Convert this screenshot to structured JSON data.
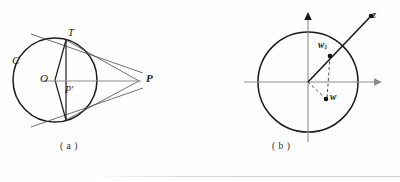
{
  "figure": {
    "page_background": "#fefefe",
    "ink_color": "#1a1a1a",
    "thin_color": "#555555",
    "panels": [
      {
        "id": "a",
        "caption": "( a )",
        "description": "circle with tangent point T, center O, inverse point P-prime and external point P",
        "labels": {
          "circle_name": "C",
          "tangent_point": "T",
          "center": "O",
          "inverse_point": "P′",
          "external_point": "P"
        },
        "geometry": {
          "circle_center": [
            55,
            80
          ],
          "circle_radius": 42,
          "point_T": [
            66,
            40
          ],
          "point_T_lower": [
            66,
            120
          ],
          "point_P": [
            139,
            81
          ],
          "point_Pprime": [
            66,
            81
          ]
        }
      },
      {
        "id": "b",
        "caption": "( b )",
        "description": "unit circle on complex plane axes with points z outside, w1 on segment, and w inside",
        "labels": {
          "outer_point": "z",
          "boundary_point": "w",
          "boundary_point_sub": "1",
          "inner_point": "w"
        },
        "geometry": {
          "origin": [
            308,
            82
          ],
          "circle_radius": 50,
          "point_z": [
            371,
            16
          ],
          "point_w1": [
            330,
            55
          ],
          "point_w": [
            325,
            100
          ],
          "x_axis": [
            244,
            82,
            378,
            82
          ],
          "y_axis": [
            308,
            14,
            308,
            142
          ]
        }
      }
    ]
  }
}
